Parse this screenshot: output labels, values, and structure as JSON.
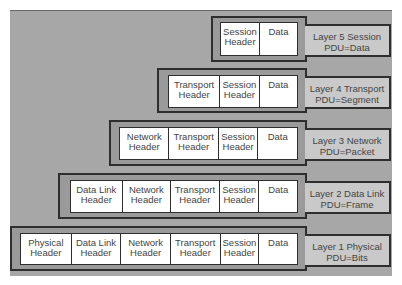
{
  "diagram": {
    "colors": {
      "background_panel": "#a7a7a7",
      "frame": "#9a9a9a",
      "cell": "#ffffff",
      "label": "#c9c9c9",
      "border": "#2e2e2e"
    },
    "layers": [
      {
        "label_line1": "Layer 5  Session",
        "label_line2": "PDU=Data",
        "cells": [
          "Session\nHeader",
          "Data"
        ]
      },
      {
        "label_line1": "Layer 4  Transport",
        "label_line2": "PDU=Segment",
        "cells": [
          "Transport\nHeader",
          "Session\nHeader",
          "Data"
        ]
      },
      {
        "label_line1": "Layer 3  Network",
        "label_line2": "PDU=Packet",
        "cells": [
          "Network\nHeader",
          "Transport\nHeader",
          "Session\nHeader",
          "Data"
        ]
      },
      {
        "label_line1": "Layer 2  Data Link",
        "label_line2": "PDU=Frame",
        "cells": [
          "Data Link\nHeader",
          "Network\nHeader",
          "Transport\nHeader",
          "Session\nHeader",
          "Data"
        ]
      },
      {
        "label_line1": "Layer 1 Physical",
        "label_line2": "PDU=Bits",
        "cells": [
          "Physical\nHeader",
          "Data Link\nHeader",
          "Network\nHeader",
          "Transport\nHeader",
          "Session\nHeader",
          "Data"
        ]
      }
    ]
  }
}
